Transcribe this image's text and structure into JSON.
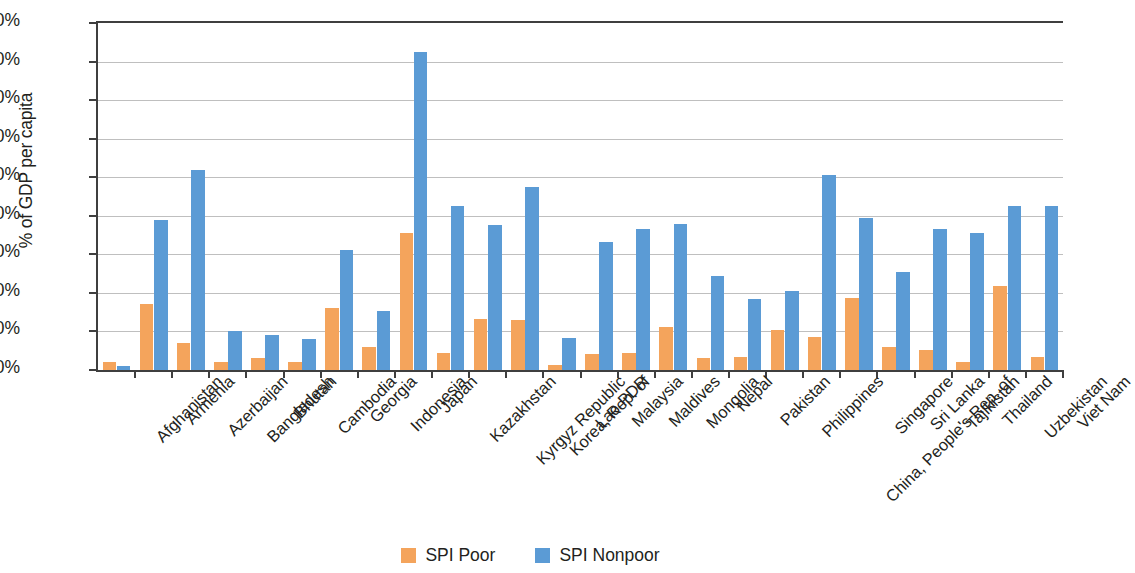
{
  "chart_data": {
    "type": "bar",
    "title": "",
    "xlabel": "",
    "ylabel": "% of GDP per capita",
    "ylim": [
      0,
      9
    ],
    "ytick_labels": [
      "0.0%",
      "1.0%",
      "2.0%",
      "3.0%",
      "4.0%",
      "5.0%",
      "6.0%",
      "7.0%",
      "8.0%",
      "9.0%"
    ],
    "ytick_values": [
      0,
      1,
      2,
      3,
      4,
      5,
      6,
      7,
      8,
      9
    ],
    "grid": true,
    "legend_position": "bottom-center",
    "categories": [
      "Afghanistan",
      "Armenia",
      "Azerbaijan",
      "Bangladesh",
      "Bhutan",
      "Cambodia",
      "Georgia",
      "Indonesia",
      "Japan",
      "Kazakhstan",
      "Kyrgyz Republic",
      "Korea, Rep. of",
      "Lao PDR",
      "Malaysia",
      "Maldives",
      "Mongolia",
      "Nepal",
      "Pakistan",
      "Philippines",
      "China, People's Rep. of",
      "Singapore",
      "Sri Lanka",
      "Tajikistan",
      "Thailand",
      "Uzbekistan",
      "Viet Nam"
    ],
    "series": [
      {
        "name": "SPI Poor",
        "color": "#f4a45c",
        "values": [
          0.2,
          1.72,
          0.7,
          0.22,
          0.3,
          0.22,
          1.6,
          0.6,
          3.55,
          0.45,
          1.32,
          1.3,
          0.12,
          0.42,
          0.45,
          1.12,
          0.3,
          0.33,
          1.05,
          0.85,
          1.88,
          0.6,
          0.52,
          0.22,
          2.17,
          0.33
        ]
      },
      {
        "name": "SPI Nonpoor",
        "color": "#5b9bd5",
        "values": [
          0.1,
          3.9,
          5.2,
          1.0,
          0.92,
          0.8,
          3.12,
          1.52,
          8.25,
          4.25,
          3.75,
          4.75,
          0.82,
          3.32,
          3.65,
          3.78,
          2.45,
          1.85,
          2.05,
          5.05,
          3.95,
          2.55,
          3.65,
          3.55,
          4.25,
          4.25
        ]
      }
    ]
  },
  "legend": {
    "items": [
      {
        "label": "SPI Poor",
        "color": "#f4a45c",
        "swatch": "legend-swatch-poor"
      },
      {
        "label": "SPI Nonpoor",
        "color": "#5b9bd5",
        "swatch": "legend-swatch-nonpoor"
      }
    ]
  }
}
